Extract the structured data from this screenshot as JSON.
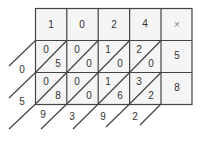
{
  "diagram": {
    "type": "lattice-multiplication",
    "top_digits": [
      "1",
      "0",
      "2",
      "4"
    ],
    "operator": "×",
    "right_digits": [
      "5",
      "8"
    ],
    "cells": [
      [
        {
          "tens": "0",
          "ones": "5"
        },
        {
          "tens": "0",
          "ones": "0"
        },
        {
          "tens": "1",
          "ones": "0"
        },
        {
          "tens": "2",
          "ones": "0"
        }
      ],
      [
        {
          "tens": "0",
          "ones": "8"
        },
        {
          "tens": "0",
          "ones": "0"
        },
        {
          "tens": "1",
          "ones": "6"
        },
        {
          "tens": "3",
          "ones": "2"
        }
      ]
    ],
    "left_results": [
      "0",
      "5"
    ],
    "bottom_results": [
      "9",
      "3",
      "9",
      "2"
    ],
    "colors": {
      "line": "#444444",
      "cell_fill": "#f4f4f4",
      "text": "#333333"
    }
  }
}
